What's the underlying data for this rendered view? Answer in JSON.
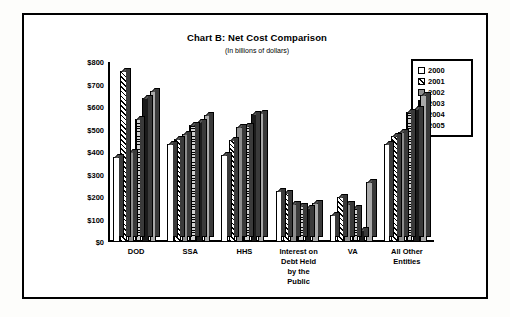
{
  "figure": {
    "title": "Chart B:  Net Cost Comparison",
    "subtitle": "(In billions of dollars)"
  },
  "legend": {
    "position": "top-right",
    "entries": [
      {
        "label": "2000",
        "pattern": "solid-white",
        "color": "#ffffff"
      },
      {
        "label": "2001",
        "pattern": "diagonal-hatch",
        "color": "#ffffff"
      },
      {
        "label": "2002",
        "pattern": "solid-gray",
        "color": "#8d8d8d"
      },
      {
        "label": "2003",
        "pattern": "grid-hatch",
        "color": "#cfcfcf"
      },
      {
        "label": "2004",
        "pattern": "solid-black",
        "color": "#1b1b1b"
      },
      {
        "label": "2005",
        "pattern": "solid-light-gray",
        "color": "#a9a9a9"
      }
    ]
  },
  "chart_data": {
    "type": "bar",
    "title": "Chart B:  Net Cost Comparison",
    "subtitle": "(In billions of dollars)",
    "xlabel": "",
    "ylabel": "",
    "ylim": [
      0,
      800
    ],
    "ytick_labels": [
      "$800",
      "$700",
      "$600",
      "$500",
      "$400",
      "$300",
      "$200",
      "$100",
      "$0"
    ],
    "ytick_values": [
      800,
      700,
      600,
      500,
      400,
      300,
      200,
      100,
      0
    ],
    "grid": false,
    "categories": [
      "DOD",
      "SSA",
      "HHS",
      "Interest on\nDebt Held\nby the\nPublic",
      "VA",
      "All Other\nEntities"
    ],
    "series": [
      {
        "name": "2000",
        "values": [
          380,
          435,
          385,
          225,
          120,
          435
        ]
      },
      {
        "name": "2001",
        "values": [
          760,
          460,
          455,
          220,
          200,
          470
        ]
      },
      {
        "name": "2002",
        "values": [
          400,
          480,
          510,
          170,
          170,
          490
        ]
      },
      {
        "name": "2003",
        "values": [
          545,
          520,
          515,
          160,
          150,
          580
        ]
      },
      {
        "name": "2004",
        "values": [
          640,
          535,
          570,
          150,
          55,
          590
        ]
      },
      {
        "name": "2005",
        "values": [
          670,
          565,
          575,
          175,
          265,
          655
        ]
      }
    ]
  }
}
